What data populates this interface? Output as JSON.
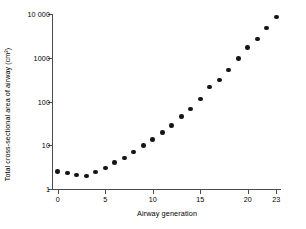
{
  "chart_data": {
    "type": "scatter",
    "title": "",
    "xlabel": "Airway generation",
    "ylabel": "Total cross-sectional area of airway (cm²)",
    "yscale": "log",
    "ylim": [
      1,
      10000
    ],
    "xlim": [
      -0.5,
      23.5
    ],
    "grid": false,
    "legend": false,
    "xticks": [
      "0",
      "5",
      "10",
      "15",
      "20",
      "23"
    ],
    "xtick_values": [
      0,
      5,
      10,
      15,
      20,
      23
    ],
    "yticks": [
      "1",
      "10",
      "100",
      "1000",
      "10 000"
    ],
    "ytick_values": [
      1,
      10,
      100,
      1000,
      10000
    ],
    "marker": "filled-circle",
    "marker_color": "#151515",
    "axis_color": "#4a4a4a",
    "x": [
      0,
      1,
      2,
      3,
      4,
      5,
      6,
      7,
      8,
      9,
      10,
      11,
      12,
      13,
      14,
      15,
      16,
      17,
      18,
      19,
      20,
      21,
      22,
      23
    ],
    "values": [
      2.5,
      2.3,
      2.1,
      2.0,
      2.45,
      3.0,
      4.0,
      5.1,
      7.0,
      9.8,
      13.5,
      19.5,
      28,
      46,
      68,
      113,
      216,
      310,
      530,
      960,
      1700,
      2700,
      4800,
      8500
    ],
    "series": [
      {
        "name": "Total cross-sectional area",
        "x": [
          0,
          1,
          2,
          3,
          4,
          5,
          6,
          7,
          8,
          9,
          10,
          11,
          12,
          13,
          14,
          15,
          16,
          17,
          18,
          19,
          20,
          21,
          22,
          23
        ],
        "values": [
          2.5,
          2.3,
          2.1,
          2.0,
          2.45,
          3.0,
          4.0,
          5.1,
          7.0,
          9.8,
          13.5,
          19.5,
          28,
          46,
          68,
          113,
          216,
          310,
          530,
          960,
          1700,
          2700,
          4800,
          8500
        ]
      }
    ]
  }
}
